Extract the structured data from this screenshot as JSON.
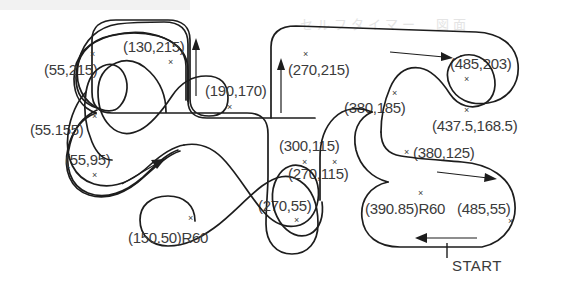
{
  "diagram": {
    "stroke_color": "#1d1d1d",
    "text_color": "#3b3b3b",
    "background_color": "#ffffff",
    "start_label": "START",
    "watermark_text": "セルフタイマー　図面"
  },
  "points": [
    {
      "id": "p-55-215",
      "text": "(55,215)",
      "x": 44,
      "y": 62,
      "mark_x": 90,
      "mark_y": 50
    },
    {
      "id": "p-130-215",
      "text": "(130,215)",
      "x": 123,
      "y": 39,
      "mark_x": 168,
      "mark_y": 58
    },
    {
      "id": "p-55-155",
      "text": "(55.155)",
      "x": 30,
      "y": 122,
      "mark_x": 92,
      "mark_y": 112
    },
    {
      "id": "p-55-95",
      "text": "(55,95)",
      "x": 65,
      "y": 152,
      "mark_x": 92,
      "mark_y": 171
    },
    {
      "id": "p-150-50-r60",
      "text": "(150.50)R60",
      "x": 128,
      "y": 230,
      "mark_x": 188,
      "mark_y": 214
    },
    {
      "id": "p-190-170",
      "text": "(190,170)",
      "x": 205,
      "y": 83,
      "mark_x": 227,
      "mark_y": 103
    },
    {
      "id": "p-270-215",
      "text": "(270,215)",
      "x": 288,
      "y": 62,
      "mark_x": 303,
      "mark_y": 50
    },
    {
      "id": "p-300-115",
      "text": "(300,115)",
      "x": 279,
      "y": 138,
      "mark_x": 302,
      "mark_y": 158
    },
    {
      "id": "p-270-115",
      "text": "(270,115)",
      "x": 288,
      "y": 166,
      "mark_x": 332,
      "mark_y": 158
    },
    {
      "id": "p-270-55",
      "text": "(270,55)",
      "x": 258,
      "y": 198,
      "mark_x": 294,
      "mark_y": 216
    },
    {
      "id": "p-380-185",
      "text": "(380,185)",
      "x": 344,
      "y": 100,
      "mark_x": 392,
      "mark_y": 89
    },
    {
      "id": "p-485-203",
      "text": "(485,203)",
      "x": 450,
      "y": 56,
      "mark_x": 464,
      "mark_y": 75
    },
    {
      "id": "p-437-168",
      "text": "(437.5,168.5)",
      "x": 432,
      "y": 118,
      "mark_x": 464,
      "mark_y": 106
    },
    {
      "id": "p-380-125",
      "text": "(380,125)",
      "x": 413,
      "y": 145,
      "mark_x": 404,
      "mark_y": 148
    },
    {
      "id": "p-390-85-r60",
      "text": "(390.85)R60",
      "x": 365,
      "y": 201,
      "mark_x": 418,
      "mark_y": 189
    },
    {
      "id": "p-485-55",
      "text": "(485,55)",
      "x": 457,
      "y": 201,
      "mark_x": 508,
      "mark_y": 217
    }
  ]
}
